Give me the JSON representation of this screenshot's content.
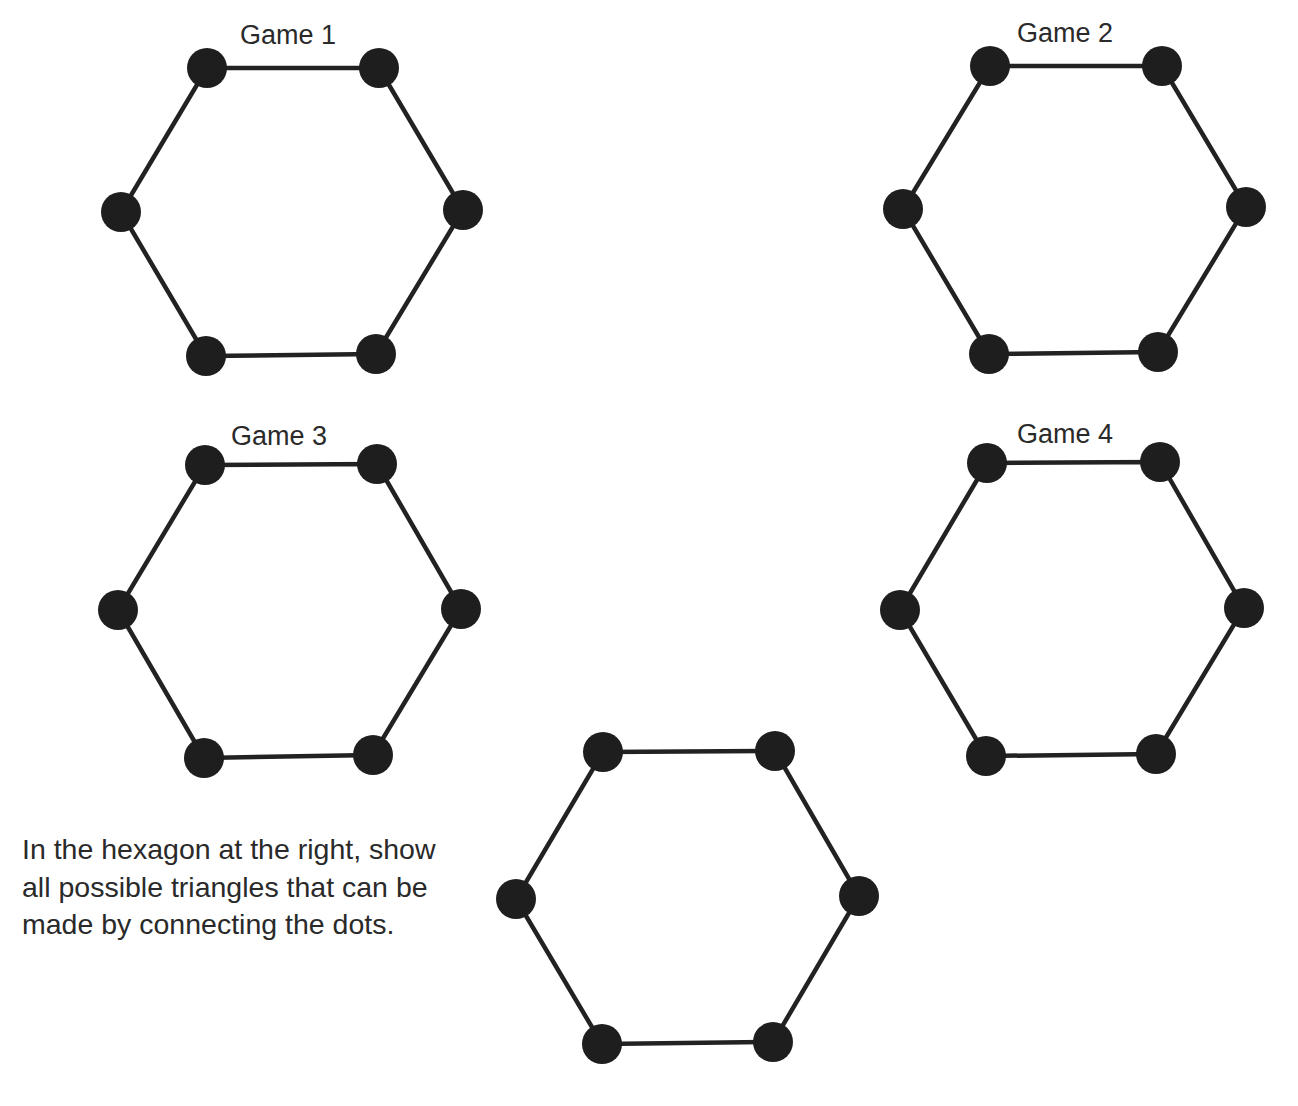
{
  "style": {
    "line_color": "#222222",
    "dot_color": "#1e1e1e",
    "text_color": "#2a2a2a",
    "dot_radius": 20,
    "line_width": 4.5
  },
  "games": [
    {
      "label": "Game 1",
      "label_pos": [
        240,
        22
      ],
      "vertices": [
        [
          207,
          68
        ],
        [
          379,
          68
        ],
        [
          463,
          210
        ],
        [
          376,
          354
        ],
        [
          206,
          356
        ],
        [
          121,
          212
        ]
      ]
    },
    {
      "label": "Game 2",
      "label_pos": [
        1017,
        20
      ],
      "vertices": [
        [
          990,
          66
        ],
        [
          1162,
          66
        ],
        [
          1246,
          207
        ],
        [
          1158,
          352
        ],
        [
          989,
          354
        ],
        [
          903,
          209
        ]
      ]
    },
    {
      "label": "Game 3",
      "label_pos": [
        231,
        423
      ],
      "vertices": [
        [
          205,
          465
        ],
        [
          377,
          464
        ],
        [
          461,
          609
        ],
        [
          373,
          755
        ],
        [
          204,
          758
        ],
        [
          118,
          610
        ]
      ]
    },
    {
      "label": "Game 4",
      "label_pos": [
        1017,
        421
      ],
      "vertices": [
        [
          987,
          463
        ],
        [
          1160,
          462
        ],
        [
          1244,
          608
        ],
        [
          1156,
          754
        ],
        [
          986,
          756
        ],
        [
          900,
          610
        ]
      ]
    }
  ],
  "practice_hexagon": {
    "vertices": [
      [
        603,
        752
      ],
      [
        775,
        751
      ],
      [
        859,
        896
      ],
      [
        773,
        1042
      ],
      [
        602,
        1044
      ],
      [
        516,
        899
      ]
    ]
  },
  "instructions": {
    "lines": [
      "In the hexagon at the right, show",
      "all possible triangles that can be",
      "made by connecting the dots."
    ]
  }
}
